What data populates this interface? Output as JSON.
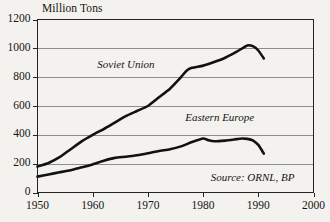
{
  "chart_data": {
    "type": "line",
    "title": "",
    "subtitle": "",
    "xlabel": "",
    "ylabel": "Million Tons",
    "ylabel_position": "top-left-horizontal",
    "xlim": [
      1950,
      2000
    ],
    "ylim": [
      0,
      1200
    ],
    "ytick_values": [
      0,
      200,
      400,
      600,
      800,
      1000,
      1200
    ],
    "ytick_labels": [
      "0",
      "200",
      "400",
      "600",
      "800",
      "1000",
      "1200"
    ],
    "xtick_values": [
      1950,
      1960,
      1970,
      1980,
      1990,
      2000
    ],
    "xtick_labels": [
      "1950",
      "1960",
      "1970",
      "1980",
      "1990",
      "2000"
    ],
    "grid": "horizontal",
    "legend_position": "inline-annotation",
    "annotations": [
      {
        "text": "Soviet Union",
        "x": 1966,
        "y": 880,
        "style": "italic"
      },
      {
        "text": "Eastern Europe",
        "x": 1983,
        "y": 510,
        "style": "italic"
      },
      {
        "text": "Source: ORNL, BP",
        "x": 1989,
        "y": 95,
        "style": "italic"
      }
    ],
    "series": [
      {
        "name": "Soviet Union",
        "color": "#111111",
        "x": [
          1950,
          1952,
          1954,
          1956,
          1958,
          1960,
          1962,
          1964,
          1966,
          1968,
          1970,
          1972,
          1974,
          1976,
          1977,
          1978,
          1980,
          1982,
          1984,
          1986,
          1988,
          1989,
          1990,
          1991
        ],
        "values": [
          180,
          205,
          245,
          300,
          355,
          400,
          440,
          485,
          530,
          565,
          600,
          660,
          720,
          800,
          845,
          865,
          880,
          905,
          935,
          975,
          1020,
          1015,
          985,
          930
        ]
      },
      {
        "name": "Eastern Europe",
        "color": "#111111",
        "x": [
          1950,
          1952,
          1954,
          1956,
          1958,
          1960,
          1962,
          1964,
          1966,
          1968,
          1970,
          1972,
          1974,
          1976,
          1978,
          1980,
          1981,
          1982,
          1984,
          1986,
          1987,
          1988,
          1989,
          1990,
          1991
        ],
        "values": [
          110,
          125,
          140,
          155,
          175,
          195,
          220,
          240,
          248,
          258,
          272,
          288,
          300,
          320,
          350,
          375,
          362,
          355,
          360,
          370,
          375,
          372,
          362,
          330,
          270
        ]
      }
    ],
    "source_note": "Source: ORNL, BP"
  },
  "style": {
    "background_color": "#f4f2ee",
    "axis_color": "#232323",
    "grid_color": "#8d8d8d",
    "text_color": "#141414",
    "curve_color": "#111111"
  }
}
